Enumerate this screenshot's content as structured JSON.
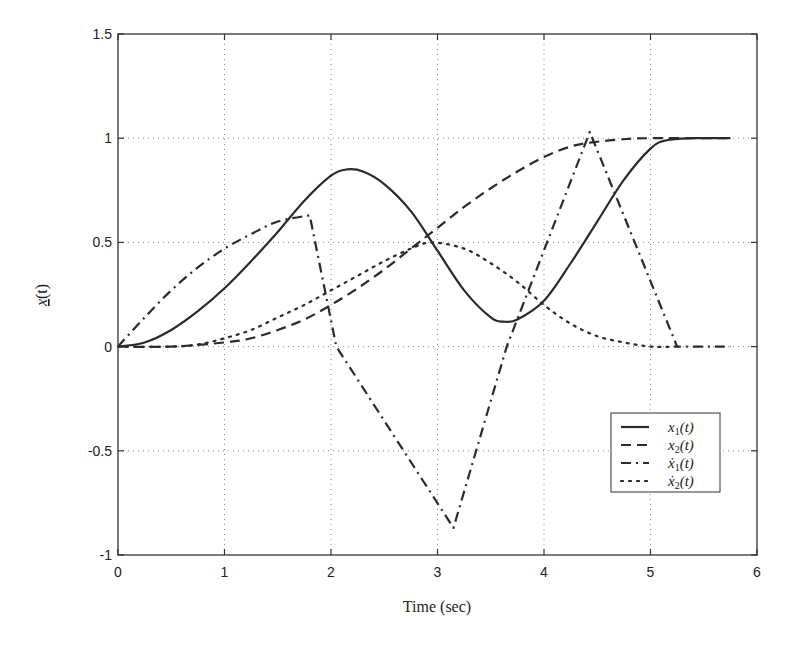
{
  "chart_data": {
    "type": "line",
    "title": "",
    "xlabel": "Time (sec)",
    "ylabel": "x(t)",
    "ylabel_note": "x underlined (vector)",
    "xlim": [
      0,
      6
    ],
    "ylim": [
      -1,
      1.5
    ],
    "xticks": [
      "0",
      "1",
      "2",
      "3",
      "4",
      "5",
      "6"
    ],
    "yticks": [
      "-1",
      "-0.5",
      "0",
      "0.5",
      "1",
      "1.5"
    ],
    "grid": true,
    "legend_position": "lower right",
    "series": [
      {
        "name": "x1(t)",
        "style": "solid",
        "x": [
          0,
          0.25,
          0.5,
          0.75,
          1.0,
          1.25,
          1.5,
          1.75,
          2.0,
          2.15,
          2.3,
          2.5,
          2.75,
          3.0,
          3.25,
          3.5,
          3.62,
          3.75,
          4.0,
          4.25,
          4.5,
          4.75,
          5.0,
          5.15,
          5.4,
          5.75
        ],
        "y": [
          0,
          0.02,
          0.08,
          0.17,
          0.28,
          0.41,
          0.55,
          0.7,
          0.82,
          0.85,
          0.84,
          0.78,
          0.65,
          0.46,
          0.27,
          0.14,
          0.12,
          0.13,
          0.22,
          0.4,
          0.6,
          0.8,
          0.95,
          0.99,
          1.0,
          1.0
        ]
      },
      {
        "name": "x2(t)",
        "style": "dashed",
        "x": [
          0,
          0.5,
          1.0,
          1.25,
          1.5,
          1.75,
          2.0,
          2.25,
          2.5,
          2.75,
          3.0,
          3.25,
          3.5,
          3.75,
          4.0,
          4.25,
          4.45,
          4.75,
          5.0,
          5.75
        ],
        "y": [
          0,
          0.0,
          0.02,
          0.04,
          0.08,
          0.13,
          0.2,
          0.28,
          0.37,
          0.47,
          0.57,
          0.67,
          0.76,
          0.84,
          0.91,
          0.96,
          0.98,
          0.995,
          1.0,
          1.0
        ]
      },
      {
        "name": "x1dot(t)",
        "style": "dashdot",
        "x": [
          0,
          0.25,
          0.5,
          0.75,
          1.0,
          1.25,
          1.5,
          1.8,
          2.05,
          3.15,
          3.65,
          4.43,
          5.25,
          5.75
        ],
        "y": [
          0,
          0.14,
          0.27,
          0.38,
          0.47,
          0.54,
          0.6,
          0.63,
          0.0,
          -0.87,
          0.0,
          1.03,
          0.0,
          0.0
        ]
      },
      {
        "name": "x2dot(t)",
        "style": "dotted",
        "x": [
          0,
          0.5,
          0.75,
          1.0,
          1.25,
          1.5,
          1.75,
          2.0,
          2.25,
          2.5,
          2.75,
          2.95,
          3.25,
          3.5,
          3.75,
          4.0,
          4.25,
          4.5,
          4.75,
          5.0,
          5.25
        ],
        "y": [
          0,
          0.0,
          0.01,
          0.04,
          0.08,
          0.14,
          0.2,
          0.27,
          0.34,
          0.41,
          0.47,
          0.5,
          0.47,
          0.4,
          0.31,
          0.2,
          0.11,
          0.05,
          0.02,
          0.0,
          0.0
        ]
      }
    ]
  },
  "legend": {
    "items": [
      {
        "symbol": "x",
        "sub": "1",
        "dot": false,
        "arg": "(t)"
      },
      {
        "symbol": "x",
        "sub": "2",
        "dot": false,
        "arg": "(t)"
      },
      {
        "symbol": "ẋ",
        "sub": "1",
        "dot": true,
        "arg": "(t)"
      },
      {
        "symbol": "ẋ",
        "sub": "2",
        "dot": true,
        "arg": "(t)"
      }
    ]
  },
  "axes": {
    "xlabel": "Time (sec)",
    "ylabel_main": "x",
    "ylabel_arg": "(t)"
  }
}
